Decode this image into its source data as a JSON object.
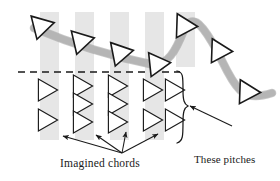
{
  "figure": {
    "background_color": "#ffffff"
  },
  "annotations": {
    "imagined_chords_label": "Imagined chords",
    "not_sounding_label_line1": "These pitches",
    "not_sounding_label_line2": "not sounding"
  },
  "colors": {
    "column_fill": "#e6e6e6",
    "ribbon": "#b5b5b5",
    "ribbon_edge": "#9a9a9a",
    "triangle_stroke": "#1a1a1a",
    "triangle_fill_sounding": "#3a3a3a",
    "triangle_fill_silent": "#ffffff",
    "dashed_line": "#1a1a1a",
    "text": "#1a1a1a",
    "arrow": "#1a1a1a",
    "brace": "#1a1a1a"
  },
  "dashed_line": {
    "name": "sounding-threshold-line",
    "x1": 18,
    "y1": 72,
    "x2": 180,
    "y2": 72,
    "dash": "7 5",
    "width": 1.3
  },
  "columns": [
    {
      "id": "col-1",
      "x": 40,
      "y": 12,
      "width": 19,
      "height": 128,
      "sounding_count": 1,
      "silent_count": 2
    },
    {
      "id": "col-2",
      "x": 75,
      "y": 12,
      "width": 19,
      "height": 128,
      "sounding_count": 1,
      "silent_count": 3
    },
    {
      "id": "col-3",
      "x": 110,
      "y": 12,
      "width": 19,
      "height": 128,
      "sounding_count": 1,
      "silent_count": 3
    },
    {
      "id": "col-4",
      "x": 145,
      "y": 12,
      "width": 19,
      "height": 128,
      "sounding_count": 1,
      "silent_count": 2
    },
    {
      "id": "col-5",
      "x": 176,
      "y": 12,
      "width": 19,
      "height": 55,
      "sounding_count": 1,
      "silent_count": 0
    }
  ],
  "ribbon": {
    "name": "melodic-contour-ribbon",
    "path": "M 34 28 C 70 43, 110 56, 150 64 C 168 67, 176 50, 184 30 C 192 14, 200 22, 212 42 C 222 58, 228 78, 240 90 C 250 99, 262 96, 272 93",
    "width": 7,
    "color": "#b5b5b5"
  },
  "sounding_triangles": [
    {
      "id": "sound-1",
      "cx": 41,
      "cy": 26,
      "size": 13,
      "rotation": -14
    },
    {
      "id": "sound-2",
      "cx": 81,
      "cy": 41,
      "size": 13,
      "rotation": -13
    },
    {
      "id": "sound-3",
      "cx": 120,
      "cy": 53,
      "size": 13,
      "rotation": -11
    },
    {
      "id": "sound-4",
      "cx": 157,
      "cy": 64,
      "size": 13,
      "rotation": -6
    },
    {
      "id": "sound-5",
      "cx": 184,
      "cy": 26,
      "size": 13,
      "rotation": 2
    },
    {
      "id": "sound-6",
      "cx": 219,
      "cy": 51,
      "size": 13,
      "rotation": 2
    },
    {
      "id": "sound-7",
      "cx": 247,
      "cy": 92,
      "size": 13,
      "rotation": 2
    }
  ],
  "silent_triangles": [
    {
      "id": "silent-1-1",
      "cx": 45,
      "cy": 90,
      "size": 12,
      "rotation": 0
    },
    {
      "id": "silent-1-2",
      "cx": 45,
      "cy": 120,
      "size": 12,
      "rotation": 0
    },
    {
      "id": "silent-2-1",
      "cx": 80,
      "cy": 86,
      "size": 12,
      "rotation": 0
    },
    {
      "id": "silent-2-2",
      "cx": 80,
      "cy": 104,
      "size": 12,
      "rotation": 0
    },
    {
      "id": "silent-2-3",
      "cx": 80,
      "cy": 122,
      "size": 12,
      "rotation": 0
    },
    {
      "id": "silent-3-1",
      "cx": 115,
      "cy": 86,
      "size": 12,
      "rotation": 0
    },
    {
      "id": "silent-3-2",
      "cx": 115,
      "cy": 104,
      "size": 12,
      "rotation": 0
    },
    {
      "id": "silent-3-3",
      "cx": 115,
      "cy": 122,
      "size": 12,
      "rotation": 0
    },
    {
      "id": "silent-4-1",
      "cx": 150,
      "cy": 90,
      "size": 12,
      "rotation": 0
    },
    {
      "id": "silent-4-2",
      "cx": 150,
      "cy": 120,
      "size": 12,
      "rotation": 0
    },
    {
      "id": "silent-5-1",
      "cx": 172,
      "cy": 90,
      "size": 12,
      "rotation": 0
    },
    {
      "id": "silent-5-2",
      "cx": 172,
      "cy": 120,
      "size": 12,
      "rotation": 0
    }
  ],
  "imagined_chord_arrows": {
    "origin_x": 122,
    "origin_y": 153,
    "targets": [
      {
        "id": "arrow-to-col-1",
        "x": 63,
        "y": 136
      },
      {
        "id": "arrow-to-col-2",
        "x": 96,
        "y": 135
      },
      {
        "id": "arrow-to-col-3",
        "x": 126,
        "y": 132
      },
      {
        "id": "arrow-to-col-4",
        "x": 158,
        "y": 134
      }
    ]
  },
  "brace": {
    "name": "not-sounding-brace",
    "path": "M 177 71 C 183 72, 183 76, 183 90 C 183 100, 184 104, 188 106 C 184 108, 183 112, 183 122 C 183 136, 183 141, 177 143",
    "tip_x": 188,
    "tip_y": 106
  },
  "pitches_arrow": {
    "name": "not-sounding-arrow",
    "from_x": 232,
    "from_y": 126,
    "to_x": 190,
    "to_y": 106
  }
}
